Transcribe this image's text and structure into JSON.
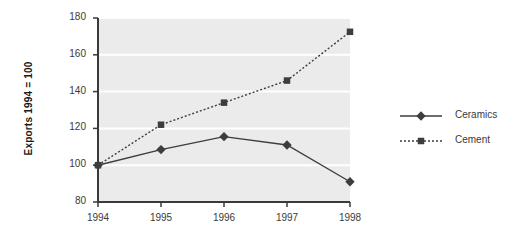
{
  "chart_data": {
    "type": "line",
    "title": "",
    "subtitle": "",
    "xlabel": "",
    "ylabel": "Exports 1994 = 100",
    "categories": [
      "1994",
      "1995",
      "1996",
      "1997",
      "1998"
    ],
    "x": [
      1994,
      1995,
      1996,
      1997,
      1998
    ],
    "series": [
      {
        "name": "Ceramics",
        "values": [
          100,
          108.5,
          115.5,
          111,
          91
        ],
        "marker": "diamond",
        "linestyle": "solid",
        "color": "#3d3d3d"
      },
      {
        "name": "Cement",
        "values": [
          100,
          122,
          134,
          146,
          172.5
        ],
        "marker": "square",
        "linestyle": "dotted",
        "color": "#3d3d3d"
      }
    ],
    "ylim": [
      80,
      180
    ],
    "yticks": [
      80,
      100,
      120,
      140,
      160,
      180
    ],
    "ytick_labels": [
      "80",
      "100",
      "120",
      "140",
      "160",
      "180"
    ],
    "xtick_labels": [
      "1994",
      "1995",
      "1996",
      "1997",
      "1998"
    ],
    "grid": "horizontal",
    "gridline_color": "#ffffff",
    "plot_background": "#ebebeb",
    "figure_background": "#ffffff",
    "axis_color": "#3a3a3a",
    "legend_position": "right",
    "legend": [
      {
        "label": "Ceramics",
        "marker": "diamond",
        "linestyle": "solid"
      },
      {
        "label": "Cement",
        "marker": "square",
        "linestyle": "dotted"
      }
    ]
  }
}
